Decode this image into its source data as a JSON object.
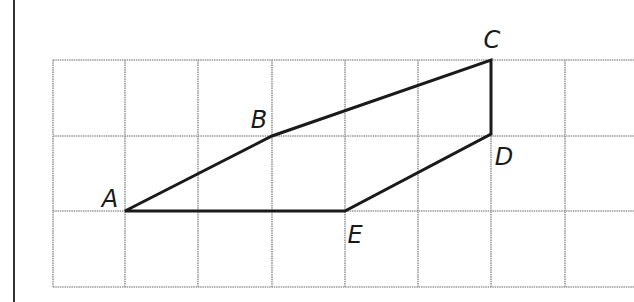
{
  "frame": {
    "left_border_x": 14,
    "border_color": "#333333"
  },
  "grid": {
    "x_lines": [
      53,
      125,
      198,
      272,
      345,
      418,
      491,
      565,
      634
    ],
    "y_lines": [
      60,
      136,
      211,
      287
    ],
    "cols": 8,
    "rows": 3,
    "cell_size_px": 73,
    "line_color": "#9a9a9a",
    "line_style": "dotted"
  },
  "shape": {
    "name": "polygon ABCDE",
    "stroke_color": "#1a1a1a",
    "stroke_width": 3,
    "vertices": [
      {
        "label": "A",
        "grid": [
          1,
          2
        ],
        "px": [
          125,
          211
        ],
        "label_px": [
          110,
          199
        ]
      },
      {
        "label": "B",
        "grid": [
          3,
          1
        ],
        "px": [
          272,
          136
        ],
        "label_px": [
          259,
          120
        ]
      },
      {
        "label": "C",
        "grid": [
          6,
          0
        ],
        "px": [
          491,
          60
        ],
        "label_px": [
          492,
          40
        ]
      },
      {
        "label": "D",
        "grid": [
          6,
          1
        ],
        "px": [
          491,
          134
        ],
        "label_px": [
          504,
          157
        ]
      },
      {
        "label": "E",
        "grid": [
          4,
          2
        ],
        "px": [
          345,
          211
        ],
        "label_px": [
          355,
          235
        ]
      }
    ],
    "edges": [
      [
        "A",
        "B"
      ],
      [
        "B",
        "C"
      ],
      [
        "C",
        "D"
      ],
      [
        "D",
        "E"
      ],
      [
        "E",
        "A"
      ]
    ]
  },
  "labels": {
    "A": "A",
    "B": "B",
    "C": "C",
    "D": "D",
    "E": "E"
  }
}
